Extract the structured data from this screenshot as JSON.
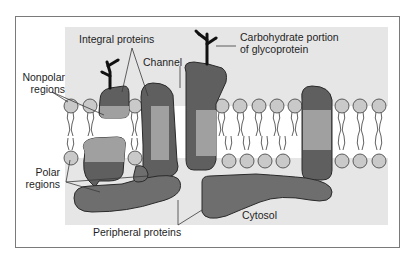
{
  "figure": {
    "labels": {
      "integral_proteins": "Integral proteins",
      "carbohydrate_line1": "Carbohydrate portion",
      "carbohydrate_line2": "of glycoprotein",
      "channel": "Channel",
      "nonpolar_line1": "Nonpolar",
      "nonpolar_line2": "regions",
      "polar_line1": "Polar",
      "polar_line2": "regions",
      "peripheral_proteins": "Peripheral proteins",
      "cytosol": "Cytosol"
    },
    "colors": {
      "background_shade": "#e6e6e6",
      "bilayer_interior": "#ffffff",
      "protein_dark": "#5f5f5f",
      "protein_mid": "#9b9b9b",
      "protein_light": "#adadad",
      "phospholipid_head": "#c9c9c9",
      "outline": "#2a2a2a",
      "carbohydrate": "#111111",
      "border": "#7a7a7a"
    }
  }
}
